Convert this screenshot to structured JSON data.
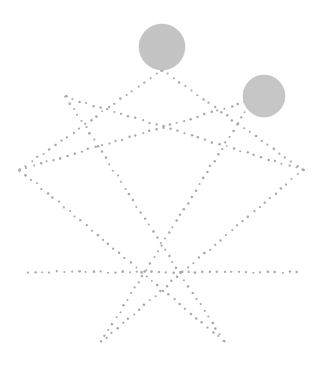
{
  "canvas": {
    "width": 322,
    "height": 366,
    "background": "#ffffff",
    "title": "Dotted pentagram with two shaded discs"
  },
  "style": {
    "dot_color": "#a8a8a8",
    "dot_radius": 1.15,
    "dot_spacing": 7.2,
    "disc_fill": "#c4c4c4",
    "disc_edge": "#b8b8b8"
  },
  "discs": [
    {
      "name": "upper-disc",
      "cx": 162,
      "cy": 47,
      "r": 23,
      "fill": "#c4c4c4"
    },
    {
      "name": "right-disc",
      "cx": 264,
      "cy": 96,
      "r": 21,
      "fill": "#c6c6c6"
    }
  ],
  "vertices": {
    "apex": {
      "x": 162,
      "y": 70
    },
    "upper_left": {
      "x": 66,
      "y": 97
    },
    "upper_right": {
      "x": 252,
      "y": 100
    },
    "left": {
      "x": 20,
      "y": 170
    },
    "right": {
      "x": 303,
      "y": 170
    },
    "bottom_left_spike": {
      "x": 101,
      "y": 342
    },
    "bottom_right_spike": {
      "x": 224,
      "y": 341
    },
    "baseline_left": {
      "x": 28,
      "y": 272
    },
    "baseline_right": {
      "x": 297,
      "y": 272
    }
  },
  "segments": [
    {
      "name": "apex-to-left",
      "from": "apex",
      "to": "left"
    },
    {
      "name": "apex-to-right",
      "from": "apex",
      "to": "right"
    },
    {
      "name": "upper-left-to-right",
      "from": "upper_left",
      "to": "right"
    },
    {
      "name": "upper-right-to-left",
      "from": "upper_right",
      "to": "left"
    },
    {
      "name": "upper-left-to-bottom-right",
      "from": "upper_left",
      "to": "bottom_right_spike"
    },
    {
      "name": "upper-right-to-bottom-left",
      "from": "upper_right",
      "to": "bottom_left_spike"
    },
    {
      "name": "left-to-bottom-right",
      "from": "left",
      "to": "bottom_right_spike"
    },
    {
      "name": "right-to-bottom-left",
      "from": "right",
      "to": "bottom_left_spike"
    },
    {
      "name": "baseline",
      "from": "baseline_left",
      "to": "baseline_right"
    }
  ],
  "labels": {
    "figure_caption": "",
    "annotation": ""
  }
}
